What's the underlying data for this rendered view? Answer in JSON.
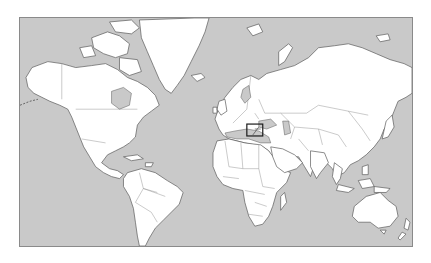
{
  "map": {
    "projection": "Mercator",
    "title": "World map",
    "colors": {
      "ocean": "#c9c9c9",
      "land": "#ffffff",
      "coastline": "#5a5a5a",
      "borders": "#8a8a8a",
      "highlight": "#1a1a1a",
      "frame": "#8a8a8a"
    },
    "frame": {
      "x": 19,
      "y": 17,
      "width": 394,
      "height": 230
    },
    "highlight_box": {
      "label": "Highlighted region: Eastern Mediterranean (Levant)",
      "x": 247,
      "y": 124,
      "width": 16,
      "height": 12
    },
    "continents": [
      "North America",
      "Greenland",
      "South America",
      "Europe",
      "Africa",
      "Asia",
      "Australia",
      "New Zealand"
    ]
  }
}
